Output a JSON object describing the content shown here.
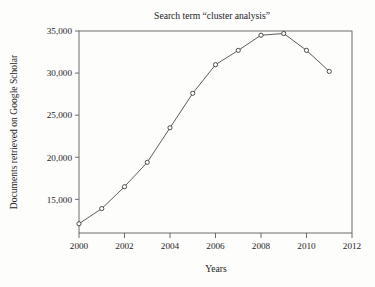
{
  "figure": {
    "background_color": "#fdfdfc",
    "axis_color": "#5d5d5d",
    "series_color": "#4a4a4a"
  },
  "chart_data": {
    "type": "line",
    "title": "Search term “cluster analysis”",
    "xlabel": "Years",
    "ylabel": "Documents retrieved on Google Scholar",
    "x": [
      2000,
      2001,
      2002,
      2003,
      2004,
      2005,
      2006,
      2007,
      2008,
      2009,
      2010,
      2011
    ],
    "values": [
      12100,
      13900,
      16500,
      19400,
      23500,
      27600,
      31000,
      32700,
      34500,
      34700,
      32700,
      30200
    ],
    "series": [
      {
        "name": "Documents retrieved on Google Scholar",
        "values": [
          12100,
          13900,
          16500,
          19400,
          23500,
          27600,
          31000,
          32700,
          34500,
          34700,
          32700,
          30200
        ]
      }
    ],
    "xlim": [
      2000,
      2012
    ],
    "ylim": [
      11000,
      35000
    ],
    "xticks": [
      2000,
      2002,
      2004,
      2006,
      2008,
      2010,
      2012
    ],
    "xtick_labels": [
      "2000",
      "2002",
      "2004",
      "2006",
      "2008",
      "2010",
      "2012"
    ],
    "yticks": [
      15000,
      20000,
      25000,
      30000,
      35000
    ],
    "ytick_labels": [
      "15,000",
      "20,000",
      "25,000",
      "30,000",
      "35,000"
    ],
    "grid": false,
    "legend": false,
    "marker": "open-circle",
    "line_style": "solid"
  }
}
